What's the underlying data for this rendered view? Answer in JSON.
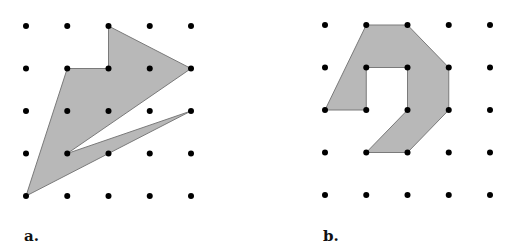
{
  "figures": [
    {
      "label": "a.",
      "origin": [
        26,
        26
      ],
      "spacing": [
        41.25,
        42.5
      ],
      "grid": [
        5,
        5
      ],
      "polygon": [
        [
          2,
          0
        ],
        [
          4,
          1
        ],
        [
          1,
          3
        ],
        [
          4,
          2
        ],
        [
          0,
          4
        ],
        [
          1,
          1
        ],
        [
          2,
          1
        ]
      ],
      "label_pos": [
        24,
        241
      ]
    },
    {
      "label": "b.",
      "origin": [
        325,
        25
      ],
      "spacing": [
        41.25,
        42.5
      ],
      "grid": [
        5,
        5
      ],
      "polygon": [
        [
          1,
          0
        ],
        [
          2,
          0
        ],
        [
          3,
          1
        ],
        [
          3,
          2
        ],
        [
          2,
          3
        ],
        [
          1,
          3
        ],
        [
          2,
          2
        ],
        [
          2,
          1
        ],
        [
          1,
          1
        ],
        [
          1,
          2
        ],
        [
          0,
          2
        ]
      ],
      "label_pos": [
        323,
        241
      ]
    }
  ],
  "colors": {
    "fill": "#b8b8b8",
    "stroke": "#7a7a7a",
    "dot": "#000000"
  }
}
